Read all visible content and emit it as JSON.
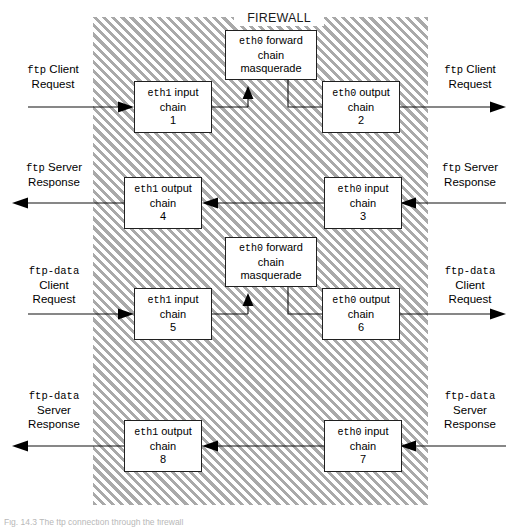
{
  "diagram": {
    "firewall_label": "FIREWALL",
    "caption": "Fig. 14.3  The ftp connection through the firewall",
    "colors": {
      "hatch": "#a9a9a9",
      "box_border": "#202020",
      "line": "#111111",
      "background": "#ffffff"
    }
  },
  "chains": {
    "eth1_input_1": {
      "iface": "eth1",
      "direction": "input",
      "line2": "chain",
      "number": "1"
    },
    "eth0_output_2": {
      "iface": "eth0",
      "direction": "output",
      "line2": "chain",
      "number": "2"
    },
    "eth0_input_3": {
      "iface": "eth0",
      "direction": "input",
      "line2": "chain",
      "number": "3"
    },
    "eth1_output_4": {
      "iface": "eth1",
      "direction": "output",
      "line2": "chain",
      "number": "4"
    },
    "eth1_input_5": {
      "iface": "eth1",
      "direction": "input",
      "line2": "chain",
      "number": "5"
    },
    "eth0_output_6": {
      "iface": "eth0",
      "direction": "output",
      "line2": "chain",
      "number": "6"
    },
    "eth0_input_7": {
      "iface": "eth0",
      "direction": "input",
      "line2": "chain",
      "number": "7"
    },
    "eth1_output_8": {
      "iface": "eth1",
      "direction": "output",
      "line2": "chain",
      "number": "8"
    }
  },
  "forward_chains": {
    "top": {
      "iface": "eth0",
      "direction": "forward",
      "line2": "chain",
      "line3": "masquerade"
    },
    "bottom": {
      "iface": "eth0",
      "direction": "forward",
      "line2": "chain",
      "line3": "masquerade"
    }
  },
  "side_labels": {
    "left_ftp_client_request": {
      "proto": "ftp",
      "l1": "Client",
      "l2": "Request"
    },
    "right_ftp_client_request": {
      "proto": "ftp",
      "l1": "Client",
      "l2": "Request"
    },
    "left_ftp_server_response": {
      "proto": "ftp",
      "l1": "Server",
      "l2": "Response"
    },
    "right_ftp_server_response": {
      "proto": "ftp",
      "l1": "Server",
      "l2": "Response"
    },
    "left_ftpdata_client_request": {
      "proto": "ftp-data",
      "l1": "Client",
      "l2": "Request"
    },
    "right_ftpdata_client_request": {
      "proto": "ftp-data",
      "l1": "Client",
      "l2": "Request"
    },
    "left_ftpdata_server_response": {
      "proto": "ftp-data",
      "l1": "Server",
      "l2": "Response"
    },
    "right_ftpdata_server_response": {
      "proto": "ftp-data",
      "l1": "Server",
      "l2": "Response"
    }
  }
}
